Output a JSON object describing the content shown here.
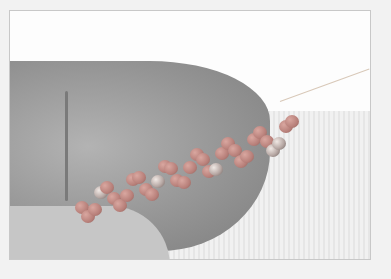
{
  "photo": {
    "subject": "beaded spiral rope held between fingers",
    "colors": {
      "background": "#f2f2f2",
      "frame_border": "#c8c8c8",
      "bead": "#c0867f",
      "metal_bead": "#c8bab6",
      "skin": "#9a9a9a"
    }
  }
}
